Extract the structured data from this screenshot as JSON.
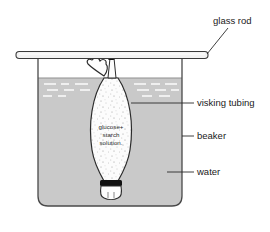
{
  "figure": {
    "background_color": "#ffffff"
  },
  "labels": {
    "glass_rod": "glass rod",
    "visking_tubing": "visking tubing",
    "beaker": "beaker",
    "water": "water"
  },
  "tubing_contents": {
    "line1": "glucose+",
    "line2": "starch",
    "line3": "solution."
  },
  "colors": {
    "water_fill": "#c9c9c9",
    "beaker_outline": "#4a4a4a",
    "glass_rod_fill": "#f2f2f2",
    "glass_rod_outline": "#3a3a3a",
    "tubing_fill": "#fbfbfb",
    "tubing_outline": "#2b2b2b",
    "tie_band": "#111111",
    "text": "#1a1a1a",
    "leader_line": "#2a2a2a",
    "waterline_dash": "#f0f0f0"
  }
}
